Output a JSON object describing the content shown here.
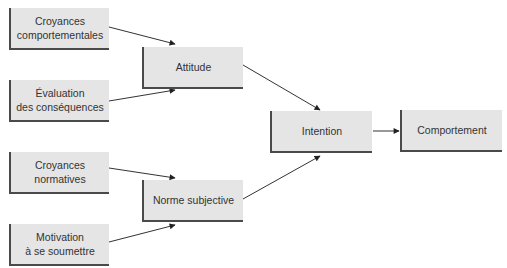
{
  "diagram": {
    "type": "flowchart",
    "nodes": [
      {
        "id": "croyances_comportementales",
        "label": "Croyances\ncomportementales"
      },
      {
        "id": "evaluation_consequences",
        "label": "Évaluation\ndes conséquences"
      },
      {
        "id": "attitude",
        "label": "Attitude"
      },
      {
        "id": "croyances_normatives",
        "label": "Croyances\nnormatives"
      },
      {
        "id": "motivation_soumettre",
        "label": "Motivation\nà se soumettre"
      },
      {
        "id": "norme_subjective",
        "label": "Norme subjective"
      },
      {
        "id": "intention",
        "label": "Intention"
      },
      {
        "id": "comportement",
        "label": "Comportement"
      }
    ],
    "edges": [
      {
        "from": "croyances_comportementales",
        "to": "attitude"
      },
      {
        "from": "evaluation_consequences",
        "to": "attitude"
      },
      {
        "from": "croyances_normatives",
        "to": "norme_subjective"
      },
      {
        "from": "motivation_soumettre",
        "to": "norme_subjective"
      },
      {
        "from": "attitude",
        "to": "intention"
      },
      {
        "from": "norme_subjective",
        "to": "intention"
      },
      {
        "from": "intention",
        "to": "comportement"
      }
    ],
    "colors": {
      "node_fill": "#e5e5e5",
      "node_shadow": "#4a4a4a",
      "text": "#333333",
      "edge": "#333333"
    }
  }
}
